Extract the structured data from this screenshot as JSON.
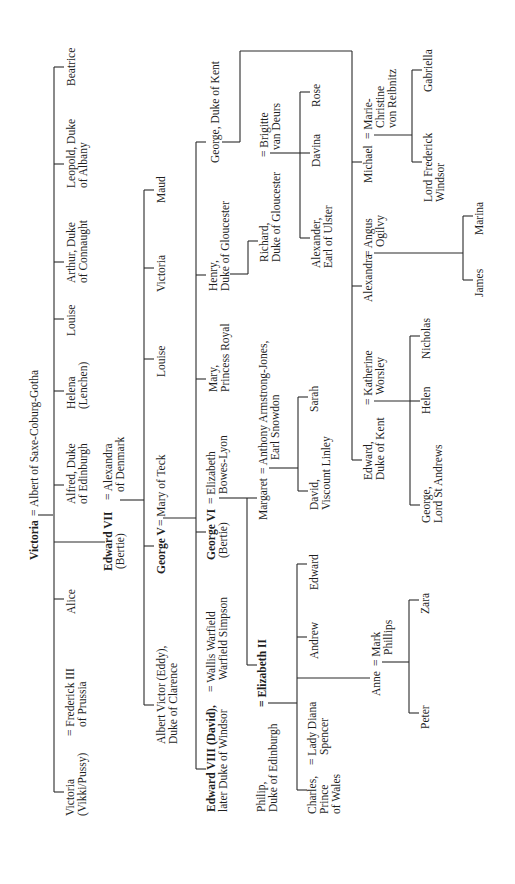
{
  "generations": {
    "gen1": {
      "victoria": "Victoria",
      "eq": "=",
      "albert": "Albert of Saxe-Coburg-Gotha"
    },
    "gen2": [
      {
        "name1": "Victoria",
        "name2": "(Vikki/Pussy)",
        "spouse1": "= Frederick III",
        "spouse2": "of Prussia"
      },
      {
        "name1": "Alice"
      },
      {
        "name1": "Edward VII",
        "name2": "(Bertie)",
        "spouse1": "= Alexandra",
        "spouse2": "of Denmark"
      },
      {
        "name1": "Alfred, Duke",
        "name2": "of Edinburgh"
      },
      {
        "name1": "Helena",
        "name2": "(Lenchen)"
      },
      {
        "name1": "Louise"
      },
      {
        "name1": "Arthur, Duke",
        "name2": "of Connaught"
      },
      {
        "name1": "Leopold, Duke",
        "name2": "of Albany"
      },
      {
        "name1": "Beatrice"
      }
    ],
    "gen3": [
      {
        "name1": "Albert Victor (Eddy),",
        "name2": "Duke of Clarence"
      },
      {
        "name1": "George V",
        "spouse": "= Mary of Teck"
      },
      {
        "name1": "Louise"
      },
      {
        "name1": "Victoria"
      },
      {
        "name1": "Maud"
      }
    ],
    "gen4": [
      {
        "name1": "Edward VIII (David),",
        "name2": "later Duke of Windsor",
        "spouse1": "= Wallis Warfield",
        "spouse2": "Warfield Simpson"
      },
      {
        "name1": "George VI",
        "name2": "(Bertie)",
        "spouse1": "= Elizabeth",
        "spouse2": "Bowes-Lyon"
      },
      {
        "name1": "Mary,",
        "name2": "Princess Royal"
      },
      {
        "name1": "Henry,",
        "name2": "Duke of Gloucester"
      },
      {
        "name1": "George, Duke of Kent"
      }
    ],
    "gen5": [
      {
        "name1": "Philip,",
        "name2": "Duke of Edinburgh",
        "spouse": "= Elizabeth II"
      },
      {
        "name1": "Margaret",
        "spouse1": "= Anthony Armstrong-Jones,",
        "spouse2": "Earl Snowdon"
      },
      {
        "name1": "Richard,",
        "name2": "Duke of Gloucester",
        "spouse1": "= Brigitte",
        "spouse2": "van Deurs"
      },
      {
        "name1": "Edward,",
        "name2": "Duke of Kent",
        "spouse1": "= Katherine",
        "spouse2": "Worsley"
      },
      {
        "name1": "Alexandra",
        "spouse1": "= Angus",
        "spouse2": "Ogilvy"
      },
      {
        "name1": "Michael",
        "spouse1": "= Marie-",
        "spouse2": "Christine",
        "spouse3": "von Reibnitz"
      }
    ],
    "gen6": [
      {
        "name1": "Charles,",
        "name2": "Prince",
        "name3": "of Wales",
        "spouse1": "= Lady Diana",
        "spouse2": "Spencer"
      },
      {
        "name1": "Anne",
        "spouse1": "= Mark",
        "spouse2": "Phillips"
      },
      {
        "name1": "Andrew"
      },
      {
        "name1": "Edward"
      },
      {
        "name1": "David,",
        "name2": "Viscount Linley"
      },
      {
        "name1": "Sarah"
      },
      {
        "name1": "Alexander,",
        "name2": "Earl of Ulster"
      },
      {
        "name1": "Davina"
      },
      {
        "name1": "Rose"
      },
      {
        "name1": "George,",
        "name2": "Lord St Andrews"
      },
      {
        "name1": "Helen"
      },
      {
        "name1": "Nicholas"
      },
      {
        "name1": "James"
      },
      {
        "name1": "Marina"
      },
      {
        "name1": "Lord Frederick",
        "name2": "Windsor"
      },
      {
        "name1": "Gabriella"
      }
    ],
    "gen7": [
      {
        "name1": "Peter"
      },
      {
        "name1": "Zara"
      }
    ]
  }
}
